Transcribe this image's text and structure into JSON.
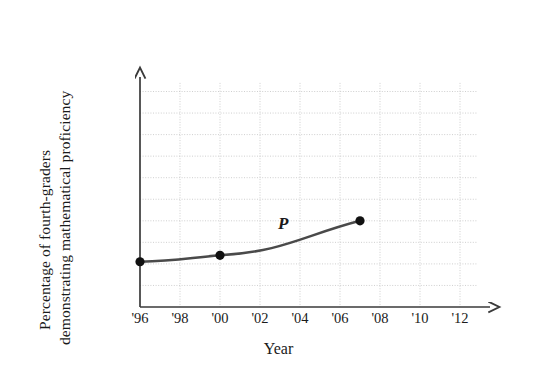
{
  "chart_data": {
    "type": "line",
    "title": "",
    "xlabel": "Year",
    "ylabel_line1": "Percentage of fourth-graders",
    "ylabel_line2": "demonstrating mathematical proficiency",
    "series": [
      {
        "name": "P",
        "x": [
          1996,
          2000,
          2007
        ],
        "values": [
          21,
          24,
          40
        ]
      }
    ],
    "x_tick_labels": [
      "'96",
      "'98",
      "'00",
      "'02",
      "'04",
      "'06",
      "'08",
      "'10",
      "'12"
    ],
    "x_tick_values": [
      1996,
      1998,
      2000,
      2002,
      2004,
      2006,
      2008,
      2010,
      2012
    ],
    "y_tick_labels": [
      "100%",
      "90",
      "80",
      "70",
      "60",
      "50",
      "40",
      "30",
      "20",
      "10"
    ],
    "y_tick_values": [
      100,
      90,
      80,
      70,
      60,
      50,
      40,
      30,
      20,
      10
    ],
    "xlim": [
      1996,
      2013.5
    ],
    "ylim": [
      0,
      104
    ],
    "grid": true,
    "grid_style": "dotted",
    "legend_position": "none",
    "annotations": [
      {
        "text": "P",
        "x": 2003.2,
        "y": 34
      }
    ],
    "colors": {
      "curve": "#4a4a4a",
      "marker": "#111111",
      "axis": "#3a3a3a",
      "grid": "#c9c9c9",
      "background": "#ffffff",
      "text": "#1a1a1a"
    }
  }
}
